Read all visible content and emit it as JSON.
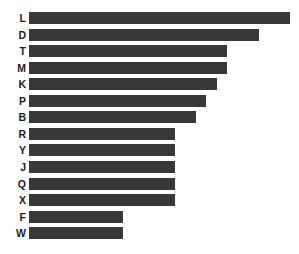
{
  "chart_data": {
    "type": "bar",
    "orientation": "horizontal",
    "title": "",
    "subtitle": "",
    "xlabel": "",
    "ylabel": "",
    "categories": [
      "L",
      "D",
      "T",
      "M",
      "K",
      "P",
      "B",
      "R",
      "Y",
      "J",
      "Q",
      "X",
      "F",
      "W"
    ],
    "values": [
      100,
      88,
      76,
      76,
      72,
      68,
      64,
      56,
      56,
      56,
      56,
      56,
      36,
      36
    ],
    "xlim": [
      0,
      100
    ],
    "grid": false,
    "legend": null,
    "tick_labels_x": [],
    "tick_labels_y": [
      "L",
      "D",
      "T",
      "M",
      "K",
      "P",
      "B",
      "R",
      "Y",
      "J",
      "Q",
      "X",
      "F",
      "W"
    ],
    "annotations": [],
    "series": [
      {
        "name": "",
        "values": [
          100,
          88,
          76,
          76,
          72,
          68,
          64,
          56,
          56,
          56,
          56,
          56,
          36,
          36
        ]
      }
    ],
    "colors": {
      "bar": "#383838",
      "background": "#ffffff",
      "label_text": "#1a1a1a"
    },
    "sorted": "descending"
  }
}
